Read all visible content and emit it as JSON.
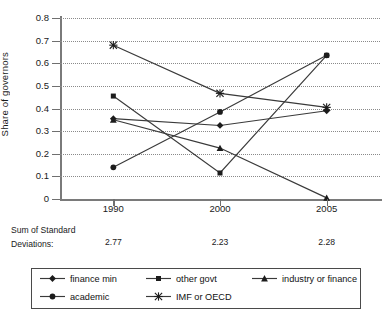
{
  "chart_data": {
    "type": "line",
    "title": "",
    "xlabel": "",
    "ylabel": "Share of governors",
    "categories": [
      "1990",
      "2000",
      "2005"
    ],
    "ylim": [
      0,
      0.8
    ],
    "ytick_labels": [
      "0",
      "0.1",
      "0.2",
      "0.3",
      "0.4",
      "0.5",
      "0.6",
      "0.7",
      "0.8"
    ],
    "ytick_values": [
      0,
      0.1,
      0.2,
      0.3,
      0.4,
      0.5,
      0.6,
      0.7,
      0.8
    ],
    "grid": true,
    "legend_position": "bottom",
    "series": [
      {
        "name": "finance min",
        "marker": "diamond",
        "values": [
          0.355,
          0.325,
          0.39
        ]
      },
      {
        "name": "other govt",
        "marker": "square",
        "values": [
          0.455,
          0.115,
          0.635
        ]
      },
      {
        "name": "industry or finance",
        "marker": "triangle",
        "values": [
          0.35,
          0.225,
          0.005
        ]
      },
      {
        "name": "academic",
        "marker": "circle",
        "values": [
          0.14,
          0.385,
          0.635
        ]
      },
      {
        "name": "IMF or OECD",
        "marker": "star",
        "values": [
          0.68,
          0.467,
          0.405
        ]
      }
    ],
    "annotations": {
      "sum_label_line1": "Sum of Standard",
      "sum_label_line2": "Deviations:",
      "sum_values": [
        "2.77",
        "2.23",
        "2.28"
      ]
    },
    "colors": {
      "series_line": "#3a3a3a",
      "marker": "#1c1c1c",
      "axis": "#7a7a7a",
      "grid": "#8a8a8a",
      "legend_border": "#4a4a4a",
      "text": "#1a1a1a",
      "background": "#ffffff"
    }
  }
}
